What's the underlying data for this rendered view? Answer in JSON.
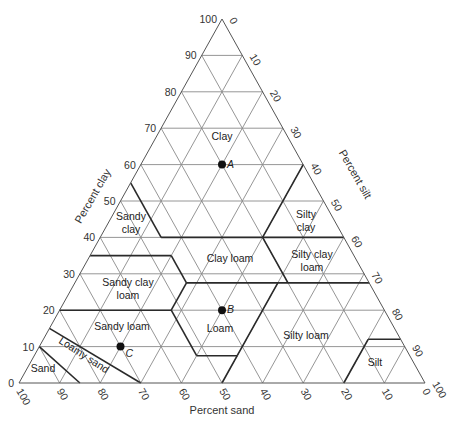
{
  "geometry": {
    "top": [
      222,
      19
    ],
    "bottom_left": [
      19,
      383
    ],
    "bottom_right": [
      425,
      383
    ]
  },
  "axes": {
    "clay": {
      "title": "Percent clay",
      "ticks": [
        "0",
        "10",
        "20",
        "30",
        "40",
        "50",
        "60",
        "70",
        "80",
        "90",
        "100"
      ]
    },
    "silt": {
      "title": "Percent silt",
      "ticks": [
        "0",
        "10",
        "20",
        "30",
        "40",
        "50",
        "60",
        "70",
        "80",
        "90",
        "100"
      ]
    },
    "sand": {
      "title": "Percent sand",
      "ticks": [
        "100",
        "90",
        "80",
        "70",
        "60",
        "50",
        "40",
        "30",
        "20",
        "10",
        "0"
      ]
    }
  },
  "regions": [
    {
      "name": "Clay",
      "lines": [
        "Clay"
      ],
      "pos": [
        222,
        140
      ]
    },
    {
      "name": "Sandy clay",
      "lines": [
        "Sandy",
        "clay"
      ],
      "pos": [
        131,
        220
      ]
    },
    {
      "name": "Silty clay",
      "lines": [
        "Silty",
        "clay"
      ],
      "pos": [
        306,
        218
      ]
    },
    {
      "name": "Clay loam",
      "lines": [
        "Clay loam"
      ],
      "pos": [
        230,
        262
      ]
    },
    {
      "name": "Silty clay loam",
      "lines": [
        "Silty clay",
        "loam"
      ],
      "pos": [
        312,
        258
      ]
    },
    {
      "name": "Sandy clay loam",
      "lines": [
        "Sandy clay",
        "loam"
      ],
      "pos": [
        128,
        286
      ]
    },
    {
      "name": "Loam",
      "lines": [
        "Loam"
      ],
      "pos": [
        220,
        332
      ]
    },
    {
      "name": "Sandy loam",
      "lines": [
        "Sandy loam"
      ],
      "pos": [
        122,
        330
      ]
    },
    {
      "name": "Silty loam",
      "lines": [
        "Silty loam"
      ],
      "pos": [
        306,
        339
      ]
    },
    {
      "name": "Loamy sand",
      "lines": [
        "Loamy sand"
      ],
      "pos": [
        82,
        358
      ],
      "rotate": 33
    },
    {
      "name": "Sand",
      "lines": [
        "Sand"
      ],
      "pos": [
        43,
        372
      ]
    },
    {
      "name": "Silt",
      "lines": [
        "Silt"
      ],
      "pos": [
        375,
        366
      ]
    }
  ],
  "points": [
    {
      "label": "A",
      "sand": 20,
      "clay": 60,
      "silt": 20
    },
    {
      "label": "B",
      "sand": 40,
      "clay": 20,
      "silt": 40
    },
    {
      "label": "C",
      "sand": 70,
      "clay": 10,
      "silt": 20
    }
  ],
  "boundaries": [
    [
      [
        45,
        55,
        0
      ],
      [
        45,
        40,
        15
      ]
    ],
    [
      [
        45,
        40,
        15
      ],
      [
        20,
        40,
        40
      ]
    ],
    [
      [
        20,
        40,
        40
      ],
      [
        0,
        40,
        60
      ]
    ],
    [
      [
        0,
        60,
        40
      ],
      [
        20,
        40,
        40
      ]
    ],
    [
      [
        65,
        35,
        0
      ],
      [
        45,
        35,
        20
      ]
    ],
    [
      [
        45,
        35,
        20
      ],
      [
        45,
        27.5,
        27.5
      ]
    ],
    [
      [
        45,
        27.5,
        27.5
      ],
      [
        20,
        27.5,
        52.5
      ]
    ],
    [
      [
        20,
        27.5,
        52.5
      ],
      [
        20,
        40,
        40
      ]
    ],
    [
      [
        20,
        27.5,
        52.5
      ],
      [
        0,
        27.5,
        72.5
      ]
    ],
    [
      [
        80,
        20,
        0
      ],
      [
        52.5,
        20,
        27.5
      ]
    ],
    [
      [
        52.5,
        20,
        27.5
      ],
      [
        45,
        27.5,
        27.5
      ]
    ],
    [
      [
        52.5,
        20,
        27.5
      ],
      [
        52.5,
        7.5,
        40
      ]
    ],
    [
      [
        52.5,
        7.5,
        40
      ],
      [
        42.5,
        7.5,
        50
      ]
    ],
    [
      [
        42.5,
        7.5,
        50
      ],
      [
        22.5,
        27.5,
        50
      ]
    ],
    [
      [
        42.5,
        7.5,
        50
      ],
      [
        50,
        0,
        50
      ]
    ],
    [
      [
        85,
        15,
        0
      ],
      [
        70,
        0,
        30
      ]
    ],
    [
      [
        90,
        10,
        0
      ],
      [
        85,
        0,
        15
      ]
    ],
    [
      [
        20,
        0,
        80
      ],
      [
        8,
        12,
        80
      ]
    ],
    [
      [
        8,
        12,
        80
      ],
      [
        0,
        12,
        88
      ]
    ]
  ]
}
